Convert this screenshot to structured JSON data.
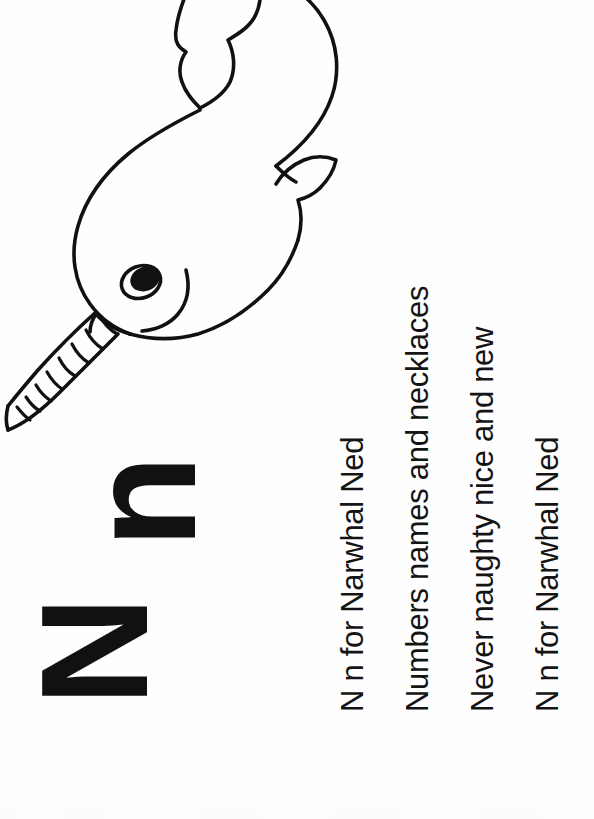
{
  "page": {
    "background_color": "#ffffff",
    "ink_color": "#111111",
    "orientation_note": "sideways",
    "width": 594,
    "height": 819
  },
  "letters": {
    "uppercase": "N",
    "lowercase": "n"
  },
  "rhyme": {
    "lines": [
      "N n for Narwhal Ned",
      "Numbers names and necklaces",
      "Never naughty nice and new",
      "N n for Narwhal Ned"
    ]
  },
  "illustration": {
    "subject": "narwhal",
    "name": "Narwhal Ned",
    "style": "line-art-coloring-page",
    "stroke_color": "#111111",
    "fill_color": "#ffffff",
    "parts": [
      "body",
      "head",
      "tusk",
      "eye",
      "mouth",
      "flipper",
      "tail-fluke"
    ],
    "tusk_segments": 9
  }
}
